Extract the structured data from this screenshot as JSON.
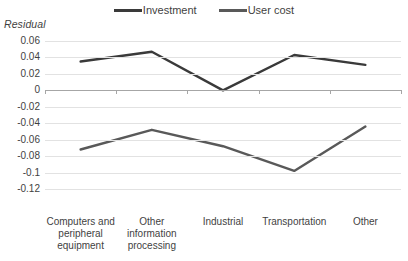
{
  "chart_data": {
    "type": "line",
    "title": "",
    "ylabel": "Residual",
    "xlabel": "",
    "ylim": [
      -0.12,
      0.06
    ],
    "ytick_values": [
      0.06,
      0.04,
      0.02,
      0,
      -0.02,
      -0.04,
      -0.06,
      -0.08,
      -0.1,
      -0.12
    ],
    "ytick_labels": [
      "0.06",
      "0.04",
      "0.02",
      "0",
      "-0.02",
      "-0.04",
      "-0.06",
      "-0.08",
      "-0.1",
      "-0.12"
    ],
    "categories": [
      "Computers and peripheral equipment",
      "Other information processing",
      "Industrial",
      "Transportation",
      "Other"
    ],
    "grid": true,
    "legend_position": "top",
    "series": [
      {
        "name": "Investment",
        "color": "#3a3a3a",
        "values": [
          0.035,
          0.047,
          0.0,
          0.043,
          0.031
        ]
      },
      {
        "name": "User cost",
        "color": "#595959",
        "values": [
          -0.072,
          -0.048,
          -0.068,
          -0.098,
          -0.044
        ]
      }
    ]
  },
  "legend": {
    "entries": [
      {
        "label": "Investment",
        "color": "#3a3a3a"
      },
      {
        "label": "User cost",
        "color": "#595959"
      }
    ]
  },
  "axis": {
    "y_title": "Residual"
  },
  "colors": {
    "gridline": "#e2e2e2",
    "zero_line": "#a6a6a6",
    "text": "#3f3f3f",
    "background": "#ffffff"
  }
}
